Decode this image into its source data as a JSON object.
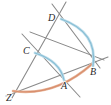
{
  "figure": {
    "background_color": "#ffffff",
    "canvas": {
      "width": 111,
      "height": 105
    },
    "colors": {
      "line_gray": "#8a8a8a",
      "line_gray_dark": "#6f6f6f",
      "arc_blue": "#86bdd4",
      "arc_blue_light": "#a8d2e2",
      "curve_orange": "#d98f6e",
      "curve_orange_light": "#e8b79c",
      "label_text": "#2a2a2a"
    }
  },
  "points": [
    {
      "id": "Z",
      "label": "Z",
      "x": 14,
      "y": 93,
      "label_x": 6,
      "label_y": 101
    },
    {
      "id": "A",
      "label": "A",
      "x": 63,
      "y": 77,
      "label_x": 61,
      "label_y": 89
    },
    {
      "id": "B",
      "label": "B",
      "x": 92,
      "y": 63,
      "label_x": 90,
      "label_y": 75
    },
    {
      "id": "C",
      "label": "C",
      "x": 33,
      "y": 53,
      "label_x": 23,
      "label_y": 54
    },
    {
      "id": "D",
      "label": "D",
      "x": 58,
      "y": 18,
      "label_x": 48,
      "label_y": 21
    }
  ],
  "segments": [
    {
      "id": "ray-Z-D-extended",
      "from": "Z",
      "to": "D",
      "x1": 12,
      "y1": 98,
      "x2": 66,
      "y2": 2
    },
    {
      "id": "ray-Z-B-extended",
      "from": "Z",
      "to": "B",
      "x1": 6,
      "y1": 96,
      "x2": 108,
      "y2": 57
    },
    {
      "id": "line-through-C-B",
      "from": "C",
      "to": "B",
      "x1": 22,
      "y1": 34,
      "x2": 80,
      "y2": 97
    },
    {
      "id": "line-D-A-extended",
      "from": "D",
      "to": "A",
      "x1": 52,
      "y1": 4,
      "x2": 100,
      "y2": 68
    },
    {
      "id": "line-upper-left-D",
      "from": "upper-left",
      "to": "D",
      "x1": 30,
      "y1": 32,
      "x2": 104,
      "y2": 60
    }
  ],
  "arcs": [
    {
      "id": "arc-D-B",
      "color": "arc_blue",
      "from": "D",
      "to": "B",
      "path": "M 61 19 Q 98 32 93 66"
    },
    {
      "id": "arc-C-A",
      "color": "arc_blue",
      "from": "C",
      "to": "A",
      "path": "M 35 53 Q 60 61 64 80"
    }
  ],
  "curves": [
    {
      "id": "curve-Z-B",
      "color": "curve_orange",
      "from": "Z",
      "to": "B",
      "path": "M 13 91 Q 55 97 92 64"
    }
  ],
  "legend": {
    "note": "No legend or axis present in figure"
  }
}
